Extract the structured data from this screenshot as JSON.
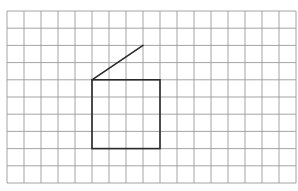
{
  "diagram": {
    "grid": {
      "origin_x": 7,
      "origin_y": 11,
      "cell_w": 17,
      "cell_h": 17.2,
      "cols": 17,
      "rows": 10,
      "line_color": "#9a9a9a",
      "line_width": 0.9
    },
    "shapes": [
      {
        "type": "square",
        "col": 5,
        "row": 4,
        "width_cells": 4,
        "height_cells": 4,
        "stroke": "#2a2a2a",
        "stroke_width": 1.6
      },
      {
        "type": "segment",
        "from": [
          5,
          4
        ],
        "to": [
          8,
          2
        ],
        "stroke": "#2a2a2a",
        "stroke_width": 1.6
      }
    ]
  }
}
